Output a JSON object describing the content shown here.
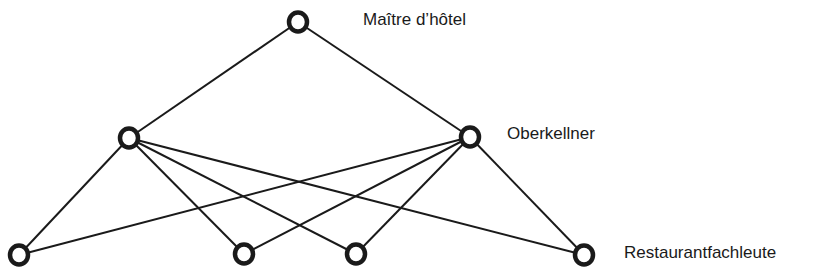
{
  "diagram": {
    "type": "hierarchy-network",
    "levels": [
      {
        "label": "Maître d’hôtel"
      },
      {
        "label": "Oberkellner"
      },
      {
        "label": "Restaurantfachleute"
      }
    ],
    "nodes": [
      {
        "id": "top",
        "x": 298,
        "y": 22
      },
      {
        "id": "m1",
        "x": 129,
        "y": 138
      },
      {
        "id": "m2",
        "x": 470,
        "y": 137
      },
      {
        "id": "b1",
        "x": 19,
        "y": 255
      },
      {
        "id": "b2",
        "x": 244,
        "y": 254
      },
      {
        "id": "b3",
        "x": 356,
        "y": 254
      },
      {
        "id": "b4",
        "x": 584,
        "y": 255
      }
    ],
    "edges": [
      [
        "top",
        "m1"
      ],
      [
        "top",
        "m2"
      ],
      [
        "m1",
        "b1"
      ],
      [
        "m1",
        "b2"
      ],
      [
        "m1",
        "b3"
      ],
      [
        "m1",
        "b4"
      ],
      [
        "m2",
        "b1"
      ],
      [
        "m2",
        "b2"
      ],
      [
        "m2",
        "b3"
      ],
      [
        "m2",
        "b4"
      ]
    ],
    "colors": {
      "line": "#1a1a1a",
      "background": "#ffffff"
    }
  }
}
